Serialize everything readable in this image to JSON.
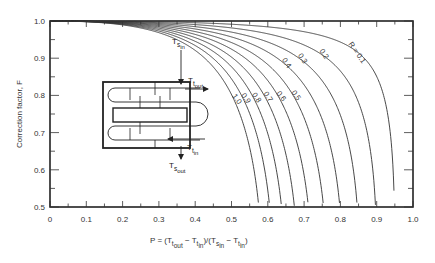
{
  "chart_data": {
    "type": "line",
    "title": "",
    "xlabel": "P = (T_t,out − T_t,in)/(T_s,in − T_t,in)",
    "ylabel": "Correction factor, F",
    "xlim": [
      0,
      1.0
    ],
    "ylim": [
      0.5,
      1.0
    ],
    "x_ticks": [
      "0",
      "0.1",
      "0.2",
      "0.3",
      "0.4",
      "0.5",
      "0.6",
      "0.7",
      "0.8",
      "0.9",
      "1.0"
    ],
    "y_ticks": [
      "0.5",
      "0.6",
      "0.7",
      "0.8",
      "0.9",
      "1.0"
    ],
    "grid": false,
    "legend": "curve labels inline (R values)",
    "series": [
      {
        "name": "R = 0.1",
        "R": 0.1,
        "p_at_F05": 0.985
      },
      {
        "name": "0.2",
        "R": 0.2,
        "p_at_F05": 0.965
      },
      {
        "name": "0.3",
        "R": 0.3,
        "p_at_F05": 0.945
      },
      {
        "name": "0.4",
        "R": 0.4,
        "p_at_F05": 0.925
      },
      {
        "name": "0.5",
        "R": 0.5,
        "p_at_F05": 0.905
      },
      {
        "name": "0.6",
        "R": 0.6,
        "p_at_F05": 0.885
      },
      {
        "name": "0.7",
        "R": 0.7,
        "p_at_F05": 0.86
      },
      {
        "name": "0.8",
        "R": 0.8,
        "p_at_F05": 0.835
      },
      {
        "name": "0.9",
        "R": 0.9,
        "p_at_F05": 0.81
      },
      {
        "name": "1.0",
        "R": 1.0,
        "p_at_F05": 0.78
      }
    ],
    "annotations": {
      "diagram": "shell-and-tube exchanger, one shell pass, two tube passes",
      "labels": [
        "T_s,in",
        "T_t,out",
        "T_t,in",
        "T_s,out"
      ]
    }
  },
  "labels": {
    "ylabel": "Correction factor, F",
    "r_prefix": "R = "
  }
}
